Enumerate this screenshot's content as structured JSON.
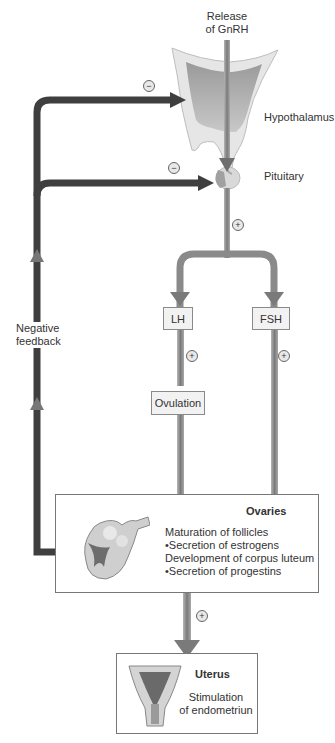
{
  "top_label": {
    "line1": "Release",
    "line2": "of GnRH"
  },
  "organs": {
    "hypothalamus": "Hypothalamus",
    "pituitary": "Pituitary"
  },
  "hormones": {
    "lh": "LH",
    "fsh": "FSH"
  },
  "ovulation": "Ovulation",
  "feedback_label": {
    "line1": "Negative",
    "line2": "feedback"
  },
  "ovaries": {
    "title": "Ovaries",
    "lines": [
      "Maturation of follicles",
      "•Secretion of estrogens",
      "Development of corpus luteum",
      "•Secretion of progestins"
    ]
  },
  "uterus": {
    "title": "Uterus",
    "line1": "Stimulation",
    "line2": "of endometriun"
  },
  "signs": {
    "minus": "−",
    "plus": "+"
  },
  "colors": {
    "arrow_dark": "#3d3d3d",
    "arrow_light": "#8c8c8c",
    "box_fill": "#f2f2f2",
    "border": "#777777"
  }
}
